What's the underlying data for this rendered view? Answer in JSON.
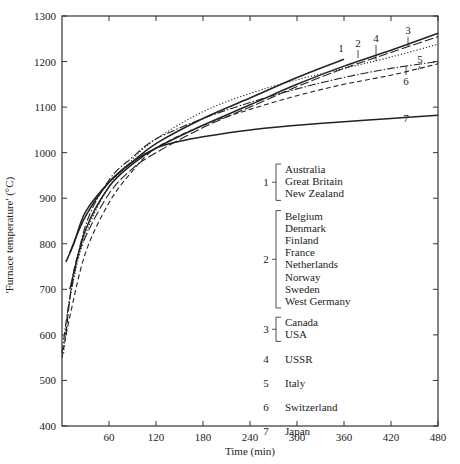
{
  "chart_data": {
    "type": "line",
    "title": "",
    "xlabel": "Time (min)",
    "ylabel": "'Furnace temperature' (°C)",
    "xlim": [
      0,
      480
    ],
    "ylim": [
      400,
      1300
    ],
    "xticks": [
      60,
      120,
      180,
      240,
      300,
      360,
      420,
      480
    ],
    "yticks": [
      400,
      500,
      600,
      700,
      800,
      900,
      1000,
      1100,
      1200,
      1300
    ],
    "grid": false,
    "legend_position": "inside, center-right",
    "series": [
      {
        "name": "1",
        "countries": [
          "Australia",
          "Great Britain",
          "New Zealand"
        ],
        "style": "solid",
        "x": [
          5,
          15,
          30,
          60,
          90,
          120,
          180,
          240,
          300,
          360
        ],
        "y": [
          760,
          800,
          870,
          935,
          980,
          1020,
          1075,
          1120,
          1165,
          1205
        ]
      },
      {
        "name": "2",
        "countries": [
          "Belgium",
          "Denmark",
          "Finland",
          "France",
          "Netherlands",
          "Norway",
          "Sweden",
          "West Germany"
        ],
        "style": "dotted",
        "x": [
          2,
          10,
          30,
          60,
          90,
          120,
          180,
          240,
          300,
          360,
          420,
          480
        ],
        "y": [
          560,
          680,
          820,
          925,
          985,
          1030,
          1090,
          1130,
          1160,
          1185,
          1210,
          1238
        ]
      },
      {
        "name": "3",
        "countries": [
          "Canada",
          "USA"
        ],
        "style": "solid",
        "x": [
          10,
          30,
          60,
          90,
          120,
          180,
          240,
          300,
          360,
          420,
          480
        ],
        "y": [
          700,
          830,
          925,
          975,
          1010,
          1060,
          1105,
          1150,
          1190,
          1225,
          1262
        ]
      },
      {
        "name": "4",
        "countries": [
          "USSR"
        ],
        "style": "longdash",
        "x": [
          5,
          15,
          30,
          60,
          90,
          120,
          180,
          240,
          300,
          360,
          420,
          480
        ],
        "y": [
          600,
          740,
          815,
          910,
          965,
          1000,
          1055,
          1100,
          1145,
          1185,
          1220,
          1255
        ]
      },
      {
        "name": "5",
        "countries": [
          "Italy"
        ],
        "style": "dashdot",
        "x": [
          0,
          10,
          30,
          60,
          90,
          120,
          180,
          240,
          300,
          360,
          420,
          480
        ],
        "y": [
          560,
          680,
          840,
          940,
          990,
          1030,
          1075,
          1110,
          1140,
          1165,
          1185,
          1200
        ]
      },
      {
        "name": "6",
        "countries": [
          "Switzerland"
        ],
        "style": "dashed",
        "x": [
          0,
          10,
          30,
          60,
          90,
          120,
          180,
          240,
          300,
          360,
          420,
          480
        ],
        "y": [
          550,
          640,
          780,
          890,
          960,
          1010,
          1060,
          1095,
          1125,
          1150,
          1170,
          1195
        ]
      },
      {
        "name": "7",
        "countries": [
          "Japan"
        ],
        "style": "solid",
        "x": [
          10,
          30,
          60,
          90,
          120,
          150,
          180,
          240,
          300,
          360,
          420,
          480
        ],
        "y": [
          780,
          860,
          935,
          980,
          1010,
          1025,
          1035,
          1050,
          1060,
          1068,
          1075,
          1082
        ]
      }
    ],
    "legend": [
      {
        "number": "1",
        "countries": [
          "Australia",
          "Great Britain",
          "New Zealand"
        ]
      },
      {
        "number": "2",
        "countries": [
          "Belgium",
          "Denmark",
          "Finland",
          "France",
          "Netherlands",
          "Norway",
          "Sweden",
          "West Germany"
        ]
      },
      {
        "number": "3",
        "countries": [
          "Canada",
          "USA"
        ]
      },
      {
        "number": "4",
        "countries": [
          "USSR"
        ]
      },
      {
        "number": "5",
        "countries": [
          "Italy"
        ]
      },
      {
        "number": "6",
        "countries": [
          "Switzerland"
        ]
      },
      {
        "number": "7",
        "countries": [
          "Japan"
        ]
      }
    ],
    "annotations": [
      {
        "text": "1",
        "x": 355,
        "y": 1215
      },
      {
        "text": "2",
        "x": 375,
        "y": 1225
      },
      {
        "text": "3",
        "x": 433,
        "y": 1260
      },
      {
        "text": "4",
        "x": 400,
        "y": 1245
      },
      {
        "text": "5",
        "x": 460,
        "y": 1205
      },
      {
        "text": "6",
        "x": 440,
        "y": 1180
      },
      {
        "text": "7",
        "x": 430,
        "y": 1060
      }
    ]
  },
  "colors": {
    "line": "#222222",
    "axis": "#333333",
    "background": "#ffffff"
  }
}
